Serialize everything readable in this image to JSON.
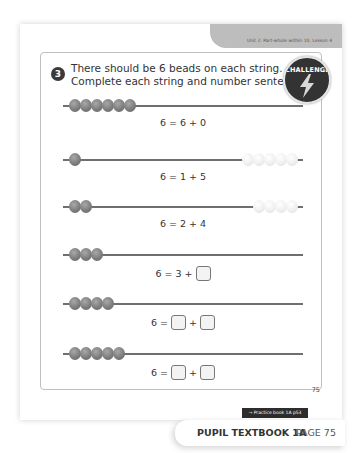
{
  "header": {
    "unit_label": "Unit 2: Part-whole within 10, Lesson 4"
  },
  "question": {
    "number": "3",
    "text_line1": "There should be 6 beads on each string.",
    "text_line2": "Complete each string and number sentence.",
    "badge_label": "CHALLENGE"
  },
  "strings": [
    {
      "dark": 6,
      "light": 0,
      "equation": {
        "total": "6",
        "a": "6",
        "b": "0"
      }
    },
    {
      "dark": 1,
      "light": 5,
      "equation": {
        "total": "6",
        "a": "1",
        "b": "5"
      }
    },
    {
      "dark": 2,
      "light": 4,
      "equation": {
        "total": "6",
        "a": "2",
        "b": "4"
      }
    },
    {
      "dark": 3,
      "light": 0,
      "equation": {
        "total": "6",
        "a": "3",
        "b": ""
      }
    },
    {
      "dark": 4,
      "light": 0,
      "equation": {
        "total": "6",
        "a": "",
        "b": ""
      }
    },
    {
      "dark": 5,
      "light": 0,
      "equation": {
        "total": "6",
        "a": "",
        "b": ""
      }
    }
  ],
  "symbols": {
    "equals": "=",
    "plus": "+"
  },
  "page_number": "75",
  "practice_tag": "→ Practice book 1A p53",
  "footer": {
    "book": "PUPIL TEXTBOOK 1A",
    "page": "PAGE 75"
  }
}
